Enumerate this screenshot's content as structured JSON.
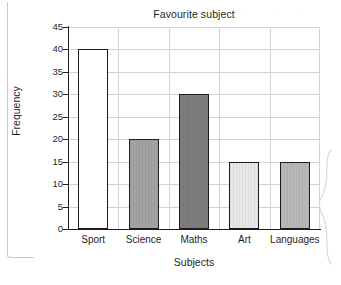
{
  "chart_data": {
    "type": "bar",
    "title": "Favourite subject",
    "xlabel": "Subjects",
    "ylabel": "Frequency",
    "categories": [
      "Sport",
      "Science",
      "Maths",
      "Art",
      "Languages"
    ],
    "values": [
      40,
      20,
      30,
      15,
      15
    ],
    "ylim": [
      0,
      45
    ],
    "ytick_step": 5,
    "yticks": [
      0,
      5,
      10,
      15,
      20,
      25,
      30,
      35,
      40,
      45
    ],
    "ytick_labels": [
      "0",
      "5",
      "10",
      "15",
      "20",
      "25",
      "30",
      "35",
      "40",
      "45"
    ],
    "grid": "both",
    "legend": "none",
    "bar_colors": [
      "#ffffff",
      "#a3a3a3",
      "#7e7e7e",
      "#e8e8e8",
      "#b9b9b9"
    ],
    "bar_edge_color": "#1c1c1c",
    "grid_color": "#d3d3d3",
    "axis_color": "#1c1c1c",
    "background": "#ffffff"
  },
  "page": {
    "bracket_left": "page-corner-bracket",
    "brace_right": "curly-brace-artifact"
  }
}
